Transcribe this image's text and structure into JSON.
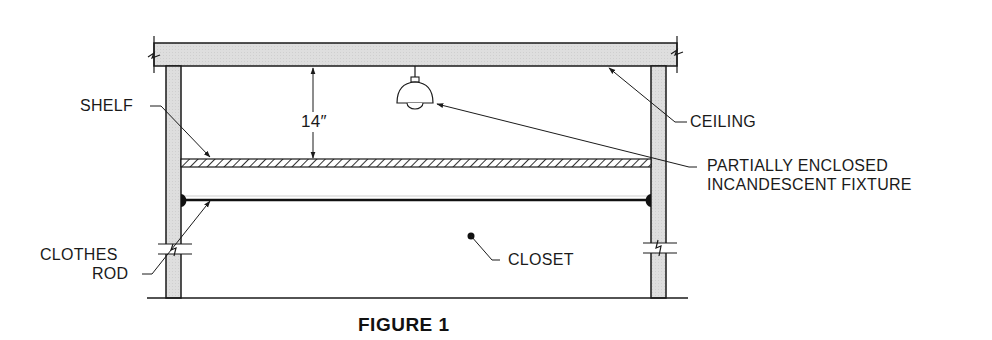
{
  "figure": {
    "title": "FIGURE 1",
    "dimension": "14″"
  },
  "labels": {
    "shelf": "SHELF",
    "ceiling": "CEILING",
    "fixture_line1": "PARTIALLY ENCLOSED",
    "fixture_line2": "INCANDESCENT FIXTURE",
    "clothes_rod_line1": "CLOTHES",
    "clothes_rod_line2": "ROD",
    "closet": "CLOSET"
  },
  "colors": {
    "line": "#1a1a1a",
    "wood_fill": "#dcdcdc",
    "background": "#ffffff"
  }
}
